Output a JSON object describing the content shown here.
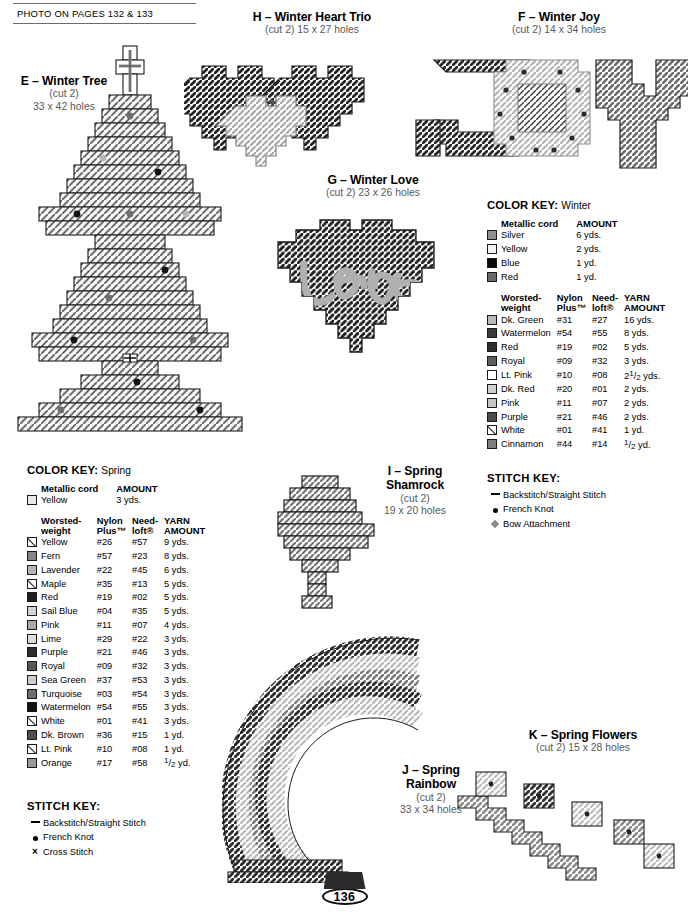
{
  "header": {
    "photo_reference": "PHOTO ON PAGES 132 & 133"
  },
  "patterns": [
    {
      "id": "E",
      "title": "E – Winter Tree",
      "cut": "(cut 2)",
      "size": "33 x 42 holes"
    },
    {
      "id": "H",
      "title": "H – Winter Heart Trio",
      "cut_size": "(cut 2) 15 x 27 holes"
    },
    {
      "id": "F",
      "title": "F – Winter Joy",
      "cut_size": "(cut 2) 14 x 34 holes"
    },
    {
      "id": "G",
      "title": "G – Winter Love",
      "cut_size": "(cut 2) 23 x 26 holes"
    },
    {
      "id": "I",
      "title_line1": "I – Spring",
      "title_line2": "Shamrock",
      "cut": "(cut 2)",
      "size": "19 x 20 holes"
    },
    {
      "id": "J",
      "title_line1": "J – Spring",
      "title_line2": "Rainbow",
      "cut": "(cut 2)",
      "size": "33 x 34 holes"
    },
    {
      "id": "K",
      "title": "K – Spring Flowers",
      "cut_size": "(cut 2) 15 x 28 holes"
    }
  ],
  "winter_key": {
    "heading": "COLOR KEY:",
    "season": "Winter",
    "metallic_section": {
      "label": "Metallic cord",
      "amount_header": "AMOUNT",
      "rows": [
        {
          "name": "Silver",
          "amount": "6 yds.",
          "color": "#8e8e8e",
          "style": "solid"
        },
        {
          "name": "Yellow",
          "amount": "2 yds.",
          "color": "#f2f2f2",
          "style": "solid"
        },
        {
          "name": "Blue",
          "amount": "1 yd.",
          "color": "#0a0a0a",
          "style": "solid"
        },
        {
          "name": "Red",
          "amount": "1 yd.",
          "color": "#6a6a6a",
          "style": "solid"
        }
      ]
    },
    "worsted_section": {
      "col1_line1": "Worsted-",
      "col1_line2": "weight",
      "col2_line1": "Nylon",
      "col2_line2": "Plus™",
      "col3_line1": "Need-",
      "col3_line2": "loft®",
      "col4_line1": "YARN",
      "col4_line2": "AMOUNT",
      "rows": [
        {
          "name": "Dk. Green",
          "nylon": "#31",
          "needloft": "#27",
          "amount": "16 yds.",
          "color": "#b9b9b9",
          "style": "solid"
        },
        {
          "name": "Watermelon",
          "nylon": "#54",
          "needloft": "#55",
          "amount": "8 yds.",
          "color": "#3a3a3a",
          "style": "solid"
        },
        {
          "name": "Red",
          "nylon": "#19",
          "needloft": "#02",
          "amount": "5 yds.",
          "color": "#2e2e2e",
          "style": "solid"
        },
        {
          "name": "Royal",
          "nylon": "#09",
          "needloft": "#32",
          "amount": "3 yds.",
          "color": "#5c5c5c",
          "style": "solid"
        },
        {
          "name": "Lt. Pink",
          "nylon": "#10",
          "needloft": "#08",
          "amount": "2½ yds.",
          "color": "#ffffff",
          "style": "solid"
        },
        {
          "name": "Dk. Red",
          "nylon": "#20",
          "needloft": "#01",
          "amount": "2 yds.",
          "color": "#cfcfcf",
          "style": "solid"
        },
        {
          "name": "Pink",
          "nylon": "#11",
          "needloft": "#07",
          "amount": "2 yds.",
          "color": "#c4c4c4",
          "style": "solid"
        },
        {
          "name": "Purple",
          "nylon": "#21",
          "needloft": "#46",
          "amount": "2 yds.",
          "color": "#4a4a4a",
          "style": "solid"
        },
        {
          "name": "White",
          "nylon": "#01",
          "needloft": "#41",
          "amount": "1 yd.",
          "color": "#ffffff",
          "style": "diag"
        },
        {
          "name": "Cinnamon",
          "nylon": "#44",
          "needloft": "#14",
          "amount": "½ yd.",
          "color": "#7d7d7d",
          "style": "solid"
        }
      ]
    }
  },
  "winter_stitch_key": {
    "heading": "STITCH KEY:",
    "rows": [
      {
        "glyph": "dash",
        "label": "Backstitch/Straight Stitch"
      },
      {
        "glyph": "dot",
        "label": "French Knot"
      },
      {
        "glyph": "bow",
        "label": "Bow Attachment"
      }
    ]
  },
  "spring_key": {
    "heading": "COLOR KEY:",
    "season": "Spring",
    "metallic_section": {
      "label": "Metallic cord",
      "amount_header": "AMOUNT",
      "rows": [
        {
          "name": "Yellow",
          "amount": "3 yds.",
          "color": "#e8e8e8",
          "style": "solid"
        }
      ]
    },
    "worsted_section": {
      "col1_line1": "Worsted-",
      "col1_line2": "weight",
      "col2_line1": "Nylon",
      "col2_line2": "Plus™",
      "col3_line1": "Need-",
      "col3_line2": "loft®",
      "col4_line1": "YARN",
      "col4_line2": "AMOUNT",
      "rows": [
        {
          "name": "Yellow",
          "nylon": "#26",
          "needloft": "#57",
          "amount": "9 yds.",
          "color": "#ffffff",
          "style": "diag"
        },
        {
          "name": "Fern",
          "nylon": "#57",
          "needloft": "#23",
          "amount": "8 yds.",
          "color": "#878787",
          "style": "solid"
        },
        {
          "name": "Lavender",
          "nylon": "#22",
          "needloft": "#45",
          "amount": "6 yds.",
          "color": "#b5b5b5",
          "style": "solid"
        },
        {
          "name": "Maple",
          "nylon": "#35",
          "needloft": "#13",
          "amount": "5 yds.",
          "color": "#ffffff",
          "style": "diag"
        },
        {
          "name": "Red",
          "nylon": "#19",
          "needloft": "#02",
          "amount": "5 yds.",
          "color": "#1d1d1d",
          "style": "solid"
        },
        {
          "name": "Sail Blue",
          "nylon": "#04",
          "needloft": "#35",
          "amount": "5 yds.",
          "color": "#d4d4d4",
          "style": "solid"
        },
        {
          "name": "Pink",
          "nylon": "#11",
          "needloft": "#07",
          "amount": "4 yds.",
          "color": "#a8a8a8",
          "style": "solid"
        },
        {
          "name": "Lime",
          "nylon": "#29",
          "needloft": "#22",
          "amount": "3 yds.",
          "color": "#dcdcdc",
          "style": "solid"
        },
        {
          "name": "Purple",
          "nylon": "#21",
          "needloft": "#46",
          "amount": "3 yds.",
          "color": "#2b2b2b",
          "style": "solid"
        },
        {
          "name": "Royal",
          "nylon": "#09",
          "needloft": "#32",
          "amount": "3 yds.",
          "color": "#575757",
          "style": "solid"
        },
        {
          "name": "Sea Green",
          "nylon": "#37",
          "needloft": "#53",
          "amount": "3 yds.",
          "color": "#cccccc",
          "style": "solid"
        },
        {
          "name": "Turquoise",
          "nylon": "#03",
          "needloft": "#54",
          "amount": "3 yds.",
          "color": "#6e6e6e",
          "style": "solid"
        },
        {
          "name": "Watermelon",
          "nylon": "#54",
          "needloft": "#55",
          "amount": "3 yds.",
          "color": "#101010",
          "style": "solid"
        },
        {
          "name": "White",
          "nylon": "#01",
          "needloft": "#41",
          "amount": "3 yds.",
          "color": "#ffffff",
          "style": "diag"
        },
        {
          "name": "Dk. Brown",
          "nylon": "#36",
          "needloft": "#15",
          "amount": "1 yd.",
          "color": "#4f4f4f",
          "style": "solid"
        },
        {
          "name": "Lt. Pink",
          "nylon": "#10",
          "needloft": "#08",
          "amount": "1 yd.",
          "color": "#ffffff",
          "style": "diag"
        },
        {
          "name": "Orange",
          "nylon": "#17",
          "needloft": "#58",
          "amount": "½ yd.",
          "color": "#9a9a9a",
          "style": "solid"
        }
      ]
    }
  },
  "spring_stitch_key": {
    "heading": "STITCH KEY:",
    "rows": [
      {
        "glyph": "dash",
        "label": "Backstitch/Straight Stitch"
      },
      {
        "glyph": "dot",
        "label": "French Knot"
      },
      {
        "glyph": "x",
        "label": "Cross Stitch"
      }
    ]
  },
  "footer": {
    "page_number": "136"
  }
}
